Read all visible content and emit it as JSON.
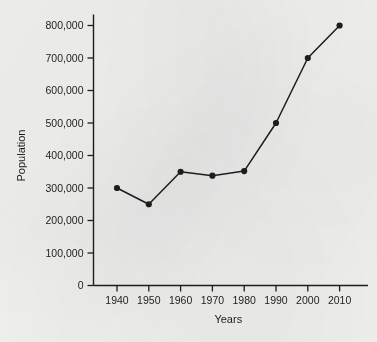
{
  "chart_data": {
    "type": "line",
    "title": "",
    "xlabel": "Years",
    "ylabel": "Population",
    "x": [
      1940,
      1950,
      1960,
      1970,
      1980,
      1990,
      2000,
      2010
    ],
    "values": [
      300000,
      250000,
      350000,
      338000,
      352000,
      500000,
      700000,
      800000
    ],
    "xtick_labels": [
      "1940",
      "1950",
      "1960",
      "1970",
      "1980",
      "1990",
      "2000",
      "2010"
    ],
    "ytick_values": [
      0,
      100000,
      200000,
      300000,
      400000,
      500000,
      600000,
      700000,
      800000
    ],
    "ytick_labels": [
      "0",
      "100,000",
      "200,000",
      "300,000",
      "400,000",
      "500,000",
      "600,000",
      "700,000",
      "800,000"
    ],
    "xlim": [
      1935,
      2015
    ],
    "ylim": [
      0,
      800000
    ],
    "grid": false,
    "legend": false,
    "marker": "filled-circle",
    "line_color": "#1d1d1d",
    "marker_color": "#1d1d1d",
    "background_color": "#f1f1f0"
  }
}
